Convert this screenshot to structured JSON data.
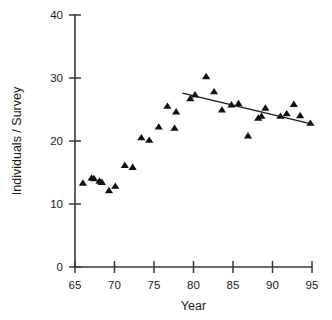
{
  "chart_data": {
    "type": "scatter",
    "title": "",
    "xlabel": "Year",
    "ylabel": "Individuals / Survey",
    "xlim": [
      65,
      95
    ],
    "ylim": [
      0,
      40
    ],
    "xticks": [
      65,
      70,
      75,
      80,
      85,
      90,
      95
    ],
    "yticks": [
      0,
      10,
      20,
      30,
      40
    ],
    "xtick_labels": [
      "65",
      "70",
      "75",
      "80",
      "85",
      "90",
      "95"
    ],
    "ytick_labels": [
      "0",
      "10",
      "20",
      "30",
      "40"
    ],
    "grid": false,
    "legend": null,
    "marker_style": "filled-triangle",
    "marker_color": "#111111",
    "series": [
      {
        "name": "Individuals per survey",
        "points": [
          [
            66.0,
            13.3
          ],
          [
            67.1,
            14.1
          ],
          [
            67.4,
            14.0
          ],
          [
            68.1,
            13.6
          ],
          [
            68.4,
            13.4
          ],
          [
            69.3,
            12.1
          ],
          [
            70.1,
            12.8
          ],
          [
            71.3,
            16.1
          ],
          [
            72.3,
            15.8
          ],
          [
            73.4,
            20.5
          ],
          [
            74.4,
            20.1
          ],
          [
            75.6,
            22.2
          ],
          [
            76.7,
            25.5
          ],
          [
            77.6,
            22.0
          ],
          [
            77.8,
            24.6
          ],
          [
            79.6,
            26.7
          ],
          [
            80.2,
            27.3
          ],
          [
            81.6,
            30.2
          ],
          [
            82.6,
            27.8
          ],
          [
            83.6,
            24.9
          ],
          [
            84.8,
            25.7
          ],
          [
            85.7,
            25.9
          ],
          [
            86.9,
            20.8
          ],
          [
            88.2,
            23.6
          ],
          [
            88.6,
            23.9
          ],
          [
            89.1,
            25.2
          ],
          [
            91.0,
            23.9
          ],
          [
            91.8,
            24.3
          ],
          [
            92.7,
            25.8
          ],
          [
            93.5,
            24.0
          ],
          [
            94.8,
            22.8
          ]
        ]
      }
    ],
    "trend_line": {
      "name": "fitted regression (1978.5-1995)",
      "x_start": 78.6,
      "y_start": 27.6,
      "x_end": 94.9,
      "y_end": 22.7
    }
  }
}
